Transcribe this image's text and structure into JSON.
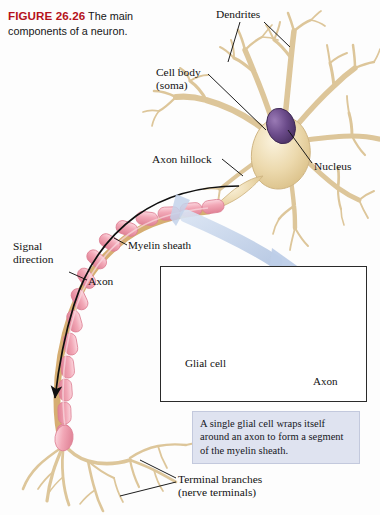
{
  "figure": {
    "number": "FIGURE 26.26",
    "caption": "The main components of a neuron."
  },
  "labels": {
    "dendrites": "Dendrites",
    "cell_body": "Cell body\n(soma)",
    "nucleus": "Nucleus",
    "axon_hillock": "Axon hillock",
    "signal_direction": "Signal\ndirection",
    "myelin_sheath": "Myelin sheath",
    "axon": "Axon",
    "glial_cell": "Glial cell",
    "axon_inset": "Axon",
    "terminal_branches": "Terminal branches\n(nerve terminals)"
  },
  "callout": {
    "text": "A single glial cell wraps itself around an axon to form a segment of the myelin sheath."
  },
  "colors": {
    "figure_number": "#b5121b",
    "soma": "#e8d4a8",
    "dendrite": "#e3cfa2",
    "nucleus": "#6b4b8a",
    "myelin": "#f0a0b0",
    "myelin_light": "#f7c4cf",
    "axon_core": "#cfa76a",
    "magnify_arrow": "#c3d2ea",
    "callout_bg": "#dfe3f0",
    "leader_line": "#222222",
    "page_bg": "#fdfdfd"
  },
  "structures": {
    "dendrite_count": 7,
    "myelin_segment_count": 14,
    "terminal_branch_count": 9,
    "wrap_arrow_count": 4
  }
}
